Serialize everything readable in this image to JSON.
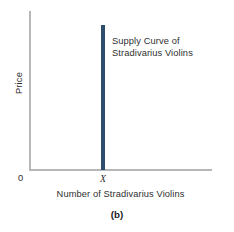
{
  "chart_data": {
    "type": "line",
    "title": "",
    "subtitle": "",
    "xlabel": "Number of Stradivarius Violins",
    "ylabel": "Price",
    "caption": "(b)",
    "origin_label": "0",
    "x_tick_labels": [
      "X"
    ],
    "y_tick_labels": [],
    "grid": false,
    "legend_position": "none",
    "annotations": [
      {
        "text_lines": [
          "Supply Curve of",
          "Stradivarius Violins"
        ],
        "x": "X",
        "y": "upper"
      }
    ],
    "series": [
      {
        "name": "Supply Curve of Stradivarius Violins",
        "shape": "vertical",
        "color": "#2e4e6e",
        "x": [
          "X",
          "X"
        ],
        "y": [
          0,
          1
        ],
        "description": "Perfectly inelastic supply: quantity fixed at X for all prices"
      }
    ],
    "xlim": [
      "0",
      "beyond X"
    ],
    "ylim": [
      0,
      1
    ]
  },
  "colors": {
    "axis": "#b6b7b9",
    "curve": "#2e4e6e",
    "text": "#2f2f2f",
    "caption": "#1d1d1d",
    "background": "#ffffff"
  }
}
